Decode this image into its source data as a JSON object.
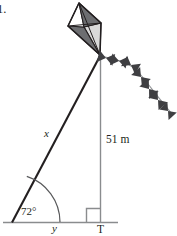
{
  "figure": {
    "problem_number": "1.",
    "background_color": "#ffffff",
    "line_color": "#6d6e71",
    "stroke_color": "#231f20",
    "text_color": "#231f20",
    "width": 177,
    "height": 236
  },
  "labels": {
    "hypotenuse": "x",
    "base": "y",
    "height": "51 m",
    "ground_point": "T",
    "angle": "72°"
  },
  "geometry": {
    "type": "right-triangle",
    "vertices": {
      "angle_vertex": [
        12,
        222
      ],
      "right_angle_vertex": [
        100,
        222
      ],
      "apex": [
        100,
        55
      ]
    },
    "known_side": "51 m",
    "known_angle": "72°",
    "unknown_sides": [
      "x",
      "y"
    ],
    "right_angle_marker": true
  },
  "kite": {
    "name": "kite",
    "top": [
      79,
      3
    ],
    "left": [
      68,
      26
    ],
    "right": [
      101,
      23
    ],
    "bottom": [
      100,
      55
    ],
    "center": [
      84,
      27
    ],
    "panel_colors": {
      "top_left": "#ffffff",
      "top_right": "#6d6e71",
      "bottom_left": "#6d6e71",
      "bottom_right": "#d9d9d9"
    },
    "outline_color": "#231f20",
    "tail": {
      "name": "kite-tail",
      "bow_count": 7,
      "bow_color": "#3f3f42",
      "string_color": "#808285",
      "path": [
        [
          101,
          57
        ],
        [
          113,
          62
        ],
        [
          125,
          64
        ],
        [
          136,
          71
        ],
        [
          146,
          82
        ],
        [
          155,
          94
        ],
        [
          165,
          105
        ],
        [
          173,
          114
        ]
      ]
    }
  }
}
